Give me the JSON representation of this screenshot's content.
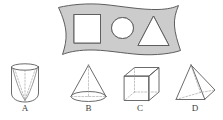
{
  "figure": {
    "type": "geometry-multiple-choice-figure",
    "background_color": "#ffffff",
    "stroke_color": "#5a5a5a",
    "fill_gray": "#cccccc",
    "cutout_fill": "#ffffff",
    "width": 223,
    "height": 120
  },
  "stem": {
    "name": "wavy-banner-with-cutouts",
    "description": "Gray wavy banner (flag-like quadrilateral with curved left and right edges) containing three white cut-out holes",
    "fill": "#cccccc",
    "cutouts": [
      {
        "id": "square",
        "label": "square-cutout",
        "shape": "square"
      },
      {
        "id": "circle",
        "label": "circle-cutout",
        "shape": "circle"
      },
      {
        "id": "triangle",
        "label": "triangle-cutout",
        "shape": "triangle"
      }
    ]
  },
  "options": [
    {
      "id": "A",
      "label": "A",
      "shape_name": "cylinder-with-conical-cavity",
      "description": "Cylinder seen in perspective with an inscribed cone / V-shaped cavity drawn inside"
    },
    {
      "id": "B",
      "label": "B",
      "shape_name": "cone",
      "description": "Right circular cone with elliptical base and dashed axis"
    },
    {
      "id": "C",
      "label": "C",
      "shape_name": "cube",
      "description": "Cube in oblique projection with dashed hidden edges"
    },
    {
      "id": "D",
      "label": "D",
      "shape_name": "square-pyramid",
      "description": "Square-based pyramid in perspective with dashed hidden edges"
    }
  ]
}
